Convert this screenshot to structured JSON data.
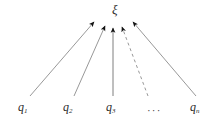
{
  "figure": {
    "type": "convergence-diagram",
    "background_color": "#ffffff",
    "line_color": "#8c8c8c",
    "arrowhead_color": "#111111",
    "text_color": "#2b2b2b",
    "target": {
      "symbol": "ξ",
      "name": "xi",
      "x": 115,
      "y": 11
    },
    "ellipsis": {
      "text": "···",
      "x": 152,
      "y": 108
    },
    "sources": [
      {
        "base": "q",
        "subscript": "1",
        "x": 22,
        "y": 108,
        "arrow_style": "solid",
        "tail": [
          30,
          96
        ],
        "head": [
          94,
          22
        ]
      },
      {
        "base": "q",
        "subscript": "2",
        "x": 67,
        "y": 108,
        "arrow_style": "solid",
        "tail": [
          74,
          96
        ],
        "head": [
          105,
          26
        ]
      },
      {
        "base": "q",
        "subscript": "3",
        "x": 109,
        "y": 108,
        "arrow_style": "solid",
        "tail": [
          113,
          96
        ],
        "head": [
          113,
          28
        ]
      },
      {
        "base": "q",
        "subscript": "n",
        "x": 194,
        "y": 108,
        "arrow_style": "solid",
        "tail": [
          196,
          96
        ],
        "head": [
          133,
          22
        ]
      }
    ],
    "dashed_arrow": {
      "style": "dashed",
      "tail": [
        148,
        96
      ],
      "head": [
        122,
        27
      ],
      "dash_pattern": "3 3"
    }
  }
}
